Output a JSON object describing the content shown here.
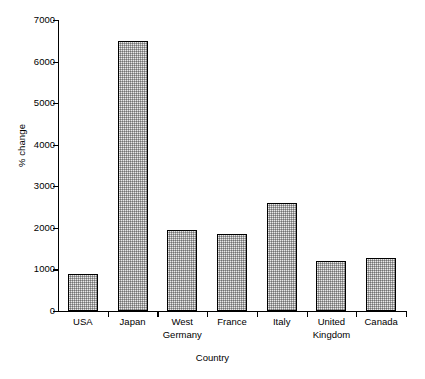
{
  "chart_data": {
    "type": "bar",
    "title": "",
    "xlabel": "Country",
    "ylabel": "% change",
    "categories": [
      "USA",
      "Japan",
      "West\nGermany",
      "France",
      "Italy",
      "United\nKingdom",
      "Canada"
    ],
    "values": [
      900,
      6500,
      1950,
      1850,
      2600,
      1200,
      1270
    ],
    "ylim": [
      0,
      7000
    ],
    "yticks": [
      0,
      1000,
      2000,
      3000,
      4000,
      5000,
      6000,
      7000
    ],
    "ytick_labels": [
      "0",
      "1000",
      "2000",
      "3000",
      "4000",
      "5000",
      "6000",
      "7000"
    ],
    "grid": false,
    "legend": false,
    "bar_fill": "#e9e9e9",
    "bar_edge": "#000000",
    "background": "#ffffff"
  }
}
